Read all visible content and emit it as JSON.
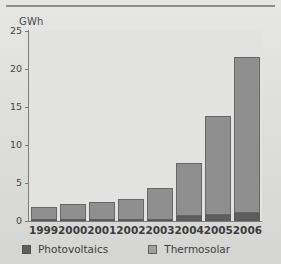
{
  "chart_data": {
    "type": "bar",
    "stacked": true,
    "title": "",
    "xlabel": "",
    "ylabel": "GWh",
    "categories": [
      "1999",
      "2000",
      "2001",
      "2002",
      "2003",
      "2004",
      "2005",
      "2006"
    ],
    "series": [
      {
        "name": "Photovoltaics",
        "color": "#5e5e5e",
        "values": [
          0.05,
          0.05,
          0.05,
          0.05,
          0.1,
          0.6,
          0.8,
          1.1
        ]
      },
      {
        "name": "Thermosolar",
        "color": "#8f8f8f",
        "values": [
          1.85,
          2.15,
          2.45,
          2.85,
          4.3,
          7.1,
          13.0,
          20.5
        ]
      }
    ],
    "totals": [
      1.9,
      2.2,
      2.5,
      2.9,
      4.4,
      7.7,
      13.8,
      21.6
    ],
    "ylim": [
      0,
      25
    ],
    "yticks": [
      0,
      5,
      10,
      15,
      20,
      25
    ],
    "ytick_labels": [
      "0",
      "5",
      "10",
      "15",
      "20",
      "25"
    ],
    "grid": false,
    "legend_position": "bottom"
  },
  "legend": {
    "items": [
      {
        "label": "Photovoltaics",
        "swatch": "pv"
      },
      {
        "label": "Thermosolar",
        "swatch": "thermo"
      }
    ]
  },
  "colors": {
    "photovoltaics": "#5e5e5e",
    "thermosolar": "#8f8f8f",
    "panel": "#e2e2e0",
    "page": "#d9d9d7",
    "axis": "#7b7b7b"
  }
}
